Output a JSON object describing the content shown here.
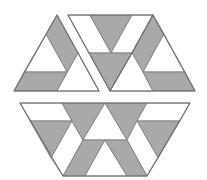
{
  "figure": {
    "title": "Hexagon dissection puzzle",
    "width": 207,
    "height": 180,
    "colors": {
      "background": "#ffffff",
      "gray": "#a9a9a9",
      "white": "#ffffff",
      "line": "#6e6e6e"
    },
    "pieces": [
      {
        "name": "top-left-triangle-piece",
        "outline": "57,15 99,91 14,91",
        "cells": [
          {
            "name": "gray-band-upper",
            "fill": "gray",
            "points": "57,15 78,53 67,72 46,34"
          },
          {
            "name": "white-triangle-left",
            "fill": "white",
            "points": "46,34 67,72 24,72"
          },
          {
            "name": "gray-band-lower",
            "fill": "gray",
            "points": "24,72 67,72 57,91 14,91"
          },
          {
            "name": "white-triangle-right",
            "fill": "white",
            "points": "78,53 99,91 57,91"
          }
        ]
      },
      {
        "name": "top-middle-piece",
        "outline": "68,15 153,15 132,53 110,91",
        "cells": [
          {
            "name": "white-strip-left",
            "fill": "white",
            "points": "68,15 90,15 111,53 89,53"
          },
          {
            "name": "gray-inverted-triangle-upper",
            "fill": "gray",
            "points": "90,15 132,15 111,53"
          },
          {
            "name": "white-triangle-upper-right",
            "fill": "white",
            "points": "132,15 153,15 132,53 111,53"
          },
          {
            "name": "gray-inverted-triangle-lower",
            "fill": "gray",
            "points": "89,53 132,53 110,91"
          }
        ]
      },
      {
        "name": "top-right-triangle-piece",
        "outline": "153,15 195,91 110,91 132,53",
        "cells": [
          {
            "name": "gray-band-upper",
            "fill": "gray",
            "points": "153,15 164,34 143,72 132,53"
          },
          {
            "name": "white-triangle-left",
            "fill": "white",
            "points": "132,53 143,72 153,91 110,91"
          },
          {
            "name": "white-triangle-right",
            "fill": "white",
            "points": "164,34 185,72 143,72"
          },
          {
            "name": "gray-band-lower",
            "fill": "gray",
            "points": "143,72 185,72 195,91 153,91"
          }
        ]
      },
      {
        "name": "bottom-trapezoid-piece",
        "outline": "20,103 190,103 147,176 63,176",
        "cells": [
          {
            "name": "white-strip-top-left",
            "fill": "white",
            "points": "20,103 62,103 72,121 30,121"
          },
          {
            "name": "gray-inverted-triangle-left",
            "fill": "gray",
            "points": "30,121 72,121 51,158"
          },
          {
            "name": "white-strip-left",
            "fill": "white",
            "points": "72,121 83,140 63,176 51,158"
          },
          {
            "name": "gray-inverted-triangle-center-left",
            "fill": "gray",
            "points": "62,103 105,103 83,140 72,121"
          },
          {
            "name": "white-triangle-center",
            "fill": "white",
            "points": "105,103 127,140 83,140"
          },
          {
            "name": "gray-inverted-triangle-center-right",
            "fill": "gray",
            "points": "105,103 147,103 137,121 127,140"
          },
          {
            "name": "white-strip-top-right",
            "fill": "white",
            "points": "147,103 190,103 180,121 137,121"
          },
          {
            "name": "gray-inverted-triangle-right",
            "fill": "gray",
            "points": "137,121 180,121 158,158"
          },
          {
            "name": "white-strip-right",
            "fill": "white",
            "points": "137,121 158,158 147,176 127,140"
          },
          {
            "name": "gray-band-bottom-left",
            "fill": "gray",
            "points": "83,140 105,140 85,176 63,176"
          },
          {
            "name": "white-triangle-bottom",
            "fill": "white",
            "points": "105,140 127,176 85,176"
          },
          {
            "name": "gray-band-bottom-right",
            "fill": "gray",
            "points": "105,140 127,140 147,176 127,176"
          }
        ]
      }
    ]
  }
}
